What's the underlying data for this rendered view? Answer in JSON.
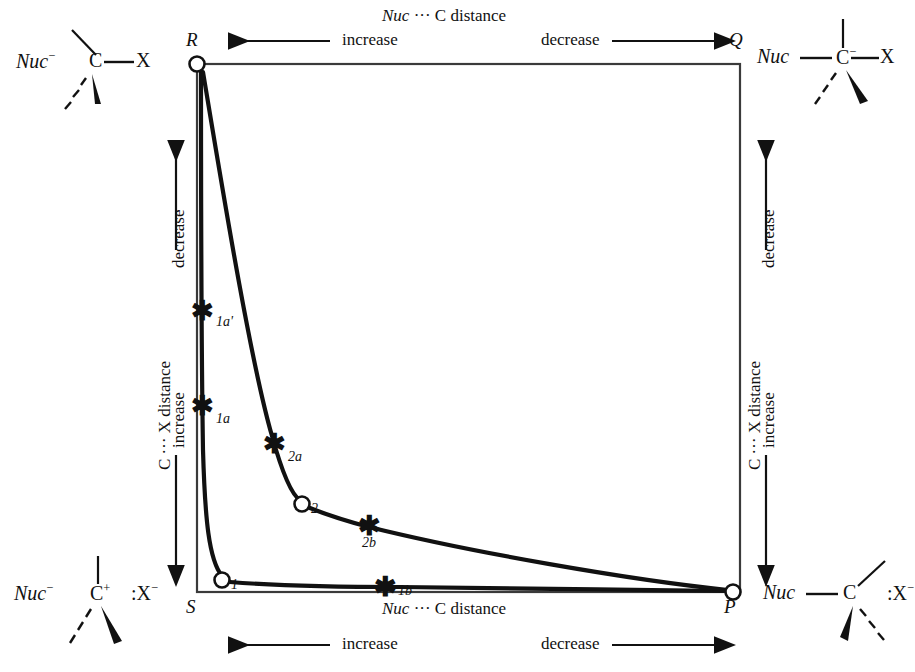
{
  "diagram": {
    "type": "more-ofarrall-jencks",
    "title_implicit": "Reaction coordinate diagram for nucleophilic substitution",
    "corners": {
      "top_left": {
        "letter": "R",
        "x_px": 197,
        "y_px": 64
      },
      "top_right": {
        "letter": "Q",
        "x_px": 740,
        "y_px": 64
      },
      "bottom_left": {
        "letter": "S",
        "x_px": 197,
        "y_px": 592
      },
      "bottom_right": {
        "letter": "P",
        "x_px": 733,
        "y_px": 592
      }
    },
    "axes": {
      "top": {
        "title": "Nuc ··· C distance",
        "left_word": "increase",
        "left_arrow": "left",
        "right_word": "decrease",
        "right_arrow": "right"
      },
      "bottom": {
        "title": "Nuc ··· C distance",
        "left_word": "increase",
        "left_arrow": "left",
        "right_word": "decrease",
        "right_arrow": "right"
      },
      "left": {
        "title": "C ··· X distance",
        "upper_word": "decrease",
        "upper_arrow": "up",
        "lower_word": "increase",
        "lower_arrow": "down"
      },
      "right": {
        "title": "C ··· X distance",
        "upper_word": "decrease",
        "upper_arrow": "up",
        "lower_word": "increase",
        "lower_arrow": "down"
      }
    },
    "molecules": {
      "top_left": {
        "nuc": "Nuc",
        "nuc_charge": "−",
        "center": "C",
        "center_charge": "",
        "leaving": "X",
        "leaving_charge": "",
        "bond_to_leaving": "single",
        "bond_to_nuc": "none",
        "description": "Nuc⁻ separate, C—X bonded"
      },
      "top_right": {
        "nuc": "Nuc",
        "nuc_charge": "",
        "center": "C",
        "center_charge": "−",
        "leaving": "X",
        "leaving_charge": "",
        "bond_to_leaving": "single",
        "bond_to_nuc": "single",
        "description": "Nuc—C⁻—X pentacoordinate"
      },
      "bottom_left": {
        "nuc": "Nuc",
        "nuc_charge": "−",
        "center": "C",
        "center_charge": "+",
        "leaving": "X",
        "leaving_charge": "−",
        "leaving_prefix": ":",
        "bond_to_leaving": "none",
        "bond_to_nuc": "none",
        "description": "Nuc⁻ C⁺ :X⁻ carbocation"
      },
      "bottom_right": {
        "nuc": "Nuc",
        "nuc_charge": "",
        "center": "C",
        "center_charge": "",
        "leaving": "X",
        "leaving_charge": "−",
        "leaving_prefix": ":",
        "bond_to_leaving": "none",
        "bond_to_nuc": "single",
        "description": "Nuc—C with :X⁻ released"
      }
    },
    "markers": [
      {
        "label": "1a'",
        "kind": "asterisk",
        "x_px": 202,
        "y_px": 310
      },
      {
        "label": "1a",
        "kind": "asterisk",
        "x_px": 202,
        "y_px": 405
      },
      {
        "label": "2a",
        "kind": "asterisk",
        "x_px": 274,
        "y_px": 443
      },
      {
        "label": "2",
        "kind": "circle",
        "x_px": 302,
        "y_px": 504
      },
      {
        "label": "2b",
        "kind": "asterisk",
        "x_px": 369,
        "y_px": 525
      },
      {
        "label": "1",
        "kind": "circle",
        "x_px": 222,
        "y_px": 580
      },
      {
        "label": "1b",
        "kind": "asterisk",
        "x_px": 385,
        "y_px": 586
      }
    ],
    "corner_circles": [
      {
        "at": "R",
        "x_px": 197,
        "y_px": 64
      },
      {
        "at": "P",
        "x_px": 733,
        "y_px": 592
      }
    ],
    "paths": [
      {
        "name": "sn1-path",
        "from": "R",
        "through": [
          "1a'",
          "1a",
          "1",
          "1b"
        ],
        "to": "P",
        "description": "stepwise SN1: R down left edge through 1a' and 1a to intermediate 1, then right along bottom through 1b to P"
      },
      {
        "name": "sn2-path",
        "from": "R",
        "through": [
          "2a",
          "2",
          "2b"
        ],
        "to": "P",
        "description": "concerted/intermediate path: R diagonally through 2a to intermediate 2, then through 2b to P"
      }
    ]
  },
  "colors": {
    "ink": "#111111",
    "paper": "#ffffff",
    "curve": "#111111",
    "frame": "#444444"
  }
}
